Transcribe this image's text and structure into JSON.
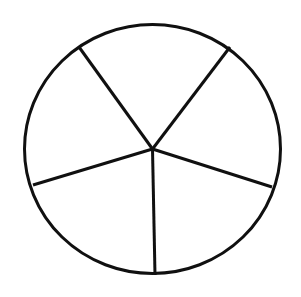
{
  "figure": {
    "title": "Circle divided into five sectors",
    "type": "sector-diagram",
    "background_color": "#ffffff",
    "stroke_color": "#101010",
    "fill_color": "#ffffff",
    "stroke_width": 3,
    "shape": {
      "name": "circle",
      "center_x": 152.5,
      "center_y": 149,
      "radius_x": 129.5,
      "radius_y": 126
    },
    "sector_count": 5,
    "radii": [
      {
        "name": "radius-bottom",
        "end_x": 155,
        "end_y": 275,
        "angle_deg": 91
      },
      {
        "name": "radius-lower-left",
        "end_x": 33,
        "end_y": 185,
        "angle_deg": 163
      },
      {
        "name": "radius-upper-left",
        "end_x": 79,
        "end_y": 47,
        "angle_deg": 235
      },
      {
        "name": "radius-upper-right",
        "end_x": 230,
        "end_y": 47,
        "angle_deg": 307
      },
      {
        "name": "radius-lower-right",
        "end_x": 272,
        "end_y": 187,
        "angle_deg": 18
      }
    ],
    "sectors": [
      {
        "name": "sector-top",
        "label": ""
      },
      {
        "name": "sector-upper-right",
        "label": ""
      },
      {
        "name": "sector-lower-right",
        "label": ""
      },
      {
        "name": "sector-lower-left",
        "label": ""
      },
      {
        "name": "sector-upper-left",
        "label": ""
      }
    ]
  }
}
